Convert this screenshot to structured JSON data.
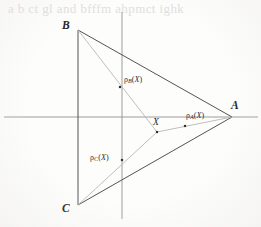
{
  "figure": {
    "background_color": "#fdfdfc",
    "ink_color": "#4a4a4d",
    "grey_line_color": "#b6b6b4",
    "axis_color": "#8d8d8e",
    "bleed_text": "a  b  ct  gl and bfffm  ahpmct ighk"
  },
  "axes": {
    "horizontal": {
      "label": "",
      "y": 117,
      "x_start": 4,
      "x_end": 258
    },
    "vertical": {
      "label": "",
      "x": 122,
      "y_start": 12,
      "y_end": 219
    }
  },
  "vertices": [
    {
      "id": "B",
      "label": "B",
      "x": 78,
      "y": 30,
      "label_x": 62,
      "label_y": 20
    },
    {
      "id": "C",
      "label": "C",
      "x": 78,
      "y": 205,
      "label_x": 62,
      "label_y": 203
    },
    {
      "id": "A",
      "label": "A",
      "x": 232,
      "y": 117,
      "label_x": 231,
      "label_y": 100
    }
  ],
  "points": [
    {
      "id": "X",
      "label": "X",
      "x": 157,
      "y": 132,
      "label_x": 153,
      "label_y": 118,
      "kind": "interior-point"
    },
    {
      "id": "rho_A",
      "rho": "ρ",
      "subscript": "A",
      "argument": "X",
      "open_paren": "(",
      "close_paren": ")",
      "x": 185,
      "y": 126,
      "label_x": 186,
      "label_y": 112,
      "kind": "projection-point"
    },
    {
      "id": "rho_B",
      "rho": "ρ",
      "subscript": "B",
      "argument": "X",
      "open_paren": "(",
      "close_paren": ")",
      "x": 120,
      "y": 87,
      "label_x": 124,
      "label_y": 76,
      "kind": "projection-point"
    },
    {
      "id": "rho_C",
      "rho": "ρ",
      "subscript": "C",
      "argument": "X",
      "open_paren": "(",
      "close_paren": ")",
      "x": 122,
      "y": 160,
      "label_x": 90,
      "label_y": 154,
      "kind": "projection-point"
    }
  ],
  "triangle_edges": [
    {
      "id": "edge-BC",
      "from": "B",
      "to": "C"
    },
    {
      "id": "edge-BA",
      "from": "B",
      "to": "A"
    },
    {
      "id": "edge-CA",
      "from": "C",
      "to": "A"
    }
  ],
  "projection_segments": [
    {
      "id": "seg-B-to-X",
      "from": "B",
      "to": "X",
      "color": "#b8b8b6"
    },
    {
      "id": "seg-C-to-X",
      "from": "C",
      "to": "X",
      "color": "#b8b8b6"
    },
    {
      "id": "seg-X-to-A",
      "from": "X",
      "to": "A",
      "color": "#b8b8b6"
    }
  ]
}
